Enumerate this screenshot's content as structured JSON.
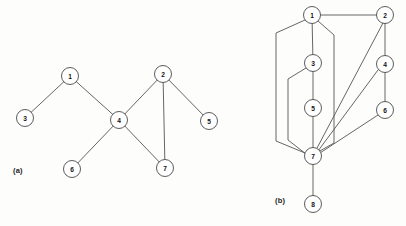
{
  "figure": {
    "background_color": "#fdfdfc",
    "node_fill_color": "#ffffff",
    "node_stroke_color": "#4a4a4a",
    "edge_color": "#555555",
    "node_radius": 8.5
  },
  "panels": [
    {
      "id": "panel-a",
      "caption": "(a)",
      "caption_x": 13,
      "caption_y": 166,
      "nodes": [
        {
          "label": "1",
          "x": 70,
          "y": 76
        },
        {
          "label": "2",
          "x": 163,
          "y": 74
        },
        {
          "label": "3",
          "x": 25,
          "y": 118
        },
        {
          "label": "4",
          "x": 119,
          "y": 120
        },
        {
          "label": "5",
          "x": 209,
          "y": 121
        },
        {
          "label": "6",
          "x": 72,
          "y": 169
        },
        {
          "label": "7",
          "x": 165,
          "y": 168
        }
      ],
      "edges": [
        {
          "from": "1",
          "to": "3",
          "path": "M 70 76 L 25 118"
        },
        {
          "from": "1",
          "to": "4",
          "path": "M 70 76 L 119 120"
        },
        {
          "from": "4",
          "to": "2",
          "path": "M 119 120 L 163 74"
        },
        {
          "from": "4",
          "to": "6",
          "path": "M 119 120 L 72 169"
        },
        {
          "from": "4",
          "to": "7",
          "path": "M 119 120 L 165 168"
        },
        {
          "from": "2",
          "to": "5",
          "path": "M 163 74 L 209 121"
        },
        {
          "from": "2",
          "to": "7",
          "path": "M 163 74 L 165 168"
        }
      ]
    },
    {
      "id": "panel-b",
      "caption": "(b)",
      "caption_x": 275,
      "caption_y": 196,
      "nodes": [
        {
          "label": "1",
          "x": 312,
          "y": 15
        },
        {
          "label": "2",
          "x": 385,
          "y": 15
        },
        {
          "label": "3",
          "x": 313,
          "y": 63
        },
        {
          "label": "4",
          "x": 385,
          "y": 64
        },
        {
          "label": "5",
          "x": 313,
          "y": 108
        },
        {
          "label": "6",
          "x": 385,
          "y": 110
        },
        {
          "label": "7",
          "x": 313,
          "y": 156
        },
        {
          "label": "8",
          "x": 313,
          "y": 204
        }
      ],
      "edges": [
        {
          "from": "1",
          "to": "2",
          "path": "M 312 15 L 385 15"
        },
        {
          "from": "1",
          "to": "3",
          "path": "M 312 15 L 313 63"
        },
        {
          "from": "3",
          "to": "5",
          "path": "M 313 63 L 313 108"
        },
        {
          "from": "5",
          "to": "7",
          "path": "M 313 108 L 313 156"
        },
        {
          "from": "7",
          "to": "8",
          "path": "M 313 156 L 313 204"
        },
        {
          "from": "2",
          "to": "4",
          "path": "M 385 15 L 385 64"
        },
        {
          "from": "4",
          "to": "6",
          "path": "M 385 64 L 385 110"
        },
        {
          "from": "2",
          "to": "7",
          "path": "M 383 23 L 316 150"
        },
        {
          "from": "4",
          "to": "7",
          "path": "M 378 70 L 318 151"
        },
        {
          "from": "6",
          "to": "7",
          "path": "M 378 115 L 320 153"
        },
        {
          "from": "1",
          "to": "7",
          "path": "M 318 21 L 334 35 L 334 143 L 318 152"
        },
        {
          "from": "1",
          "to": "7",
          "path": "M 305 20 L 276 33 L 276 141 L 305 153"
        },
        {
          "from": "3",
          "to": "7",
          "path": "M 306 68 L 288 79 L 288 140 L 306 154"
        }
      ]
    }
  ]
}
